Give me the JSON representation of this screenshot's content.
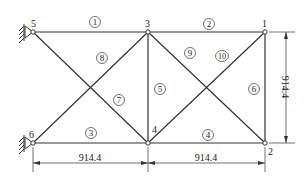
{
  "diagram": {
    "type": "truss",
    "nodes": [
      {
        "id": "1",
        "x": 265,
        "y": 32
      },
      {
        "id": "2",
        "x": 265,
        "y": 143
      },
      {
        "id": "3",
        "x": 148,
        "y": 32
      },
      {
        "id": "4",
        "x": 148,
        "y": 143
      },
      {
        "id": "5",
        "x": 33,
        "y": 32
      },
      {
        "id": "6",
        "x": 33,
        "y": 143
      }
    ],
    "members": [
      {
        "id": "1",
        "from": "5",
        "to": "3"
      },
      {
        "id": "2",
        "from": "3",
        "to": "1"
      },
      {
        "id": "3",
        "from": "6",
        "to": "4"
      },
      {
        "id": "4",
        "from": "4",
        "to": "2"
      },
      {
        "id": "5",
        "from": "3",
        "to": "4"
      },
      {
        "id": "6",
        "from": "1",
        "to": "2"
      },
      {
        "id": "7",
        "from": "5",
        "to": "4"
      },
      {
        "id": "8",
        "from": "6",
        "to": "3"
      },
      {
        "id": "9",
        "from": "3",
        "to": "2"
      },
      {
        "id": "10",
        "from": "4",
        "to": "1"
      }
    ],
    "supports": [
      "5",
      "6"
    ],
    "dimensions": {
      "horizontal_left": "914.4",
      "horizontal_right": "914.4",
      "vertical": "914.4"
    }
  }
}
